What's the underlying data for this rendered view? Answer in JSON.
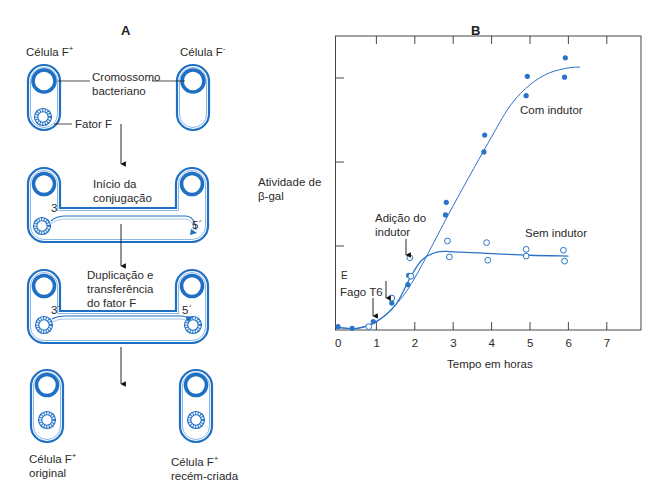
{
  "panel_a": {
    "letter": "A",
    "cell_f_plus_label": "Célula F",
    "cell_f_plus_sup": "+",
    "cell_f_minus_label": "Célula F",
    "cell_f_minus_sup": "-",
    "chromosome_label_line1": "Cromossomo",
    "chromosome_label_line2": "bacteriano",
    "fator_f_label": "Fator F",
    "step2_line1": "Início da",
    "step2_line2": "conjugação",
    "step2_end3": "3",
    "step2_end5": "5´",
    "step3_line1": "Duplicação e",
    "step3_line2": "transferência",
    "step3_line3": "do fator F",
    "step3_end3": "3´",
    "step3_end5": "5´",
    "result_left_line1": "Célula F",
    "result_left_sup": "+",
    "result_left_line2": "original",
    "result_right_line1": "Célula F",
    "result_right_sup": "+",
    "result_right_line2": "recém-criada",
    "colors": {
      "cell_blue": "#1f6fc4",
      "cell_light": "#8cb8e6"
    }
  },
  "panel_b": {
    "letter": "B",
    "ylabel_line1": "Atividade de",
    "ylabel_line2": "β-gal",
    "xlabel": "Tempo em horas",
    "x_ticks": [
      "0",
      "1",
      "2",
      "3",
      "4",
      "5",
      "6",
      "7"
    ],
    "annot_inductor_line1": "Adição do",
    "annot_inductor_line2": "indutor",
    "annot_phage": "Fago T6",
    "annot_e": "E",
    "series_with_label": "Com indutor",
    "series_without_label": "Sem indutor"
  },
  "chart_data": {
    "type": "scatter",
    "title": "B",
    "xlabel": "Tempo em horas",
    "ylabel": "Atividade de β-gal",
    "xlim": [
      0,
      7.8
    ],
    "ylim": [
      0,
      3.5
    ],
    "x_ticks": [
      0,
      1,
      2,
      3,
      4,
      5,
      6,
      7
    ],
    "y_ticks": [
      1,
      2,
      3
    ],
    "grid": false,
    "annotations": [
      {
        "text": "Fago T6",
        "x": 1.0,
        "arrow": true
      },
      {
        "text": "",
        "x": 1.4,
        "arrow": true
      },
      {
        "text": "Adição do indutor",
        "x": 1.9,
        "arrow": true
      },
      {
        "text": "E",
        "x": 0.05,
        "y": 0.75
      }
    ],
    "series": [
      {
        "name": "Com indutor",
        "marker": "filled-circle",
        "points": [
          [
            0.0,
            0.04
          ],
          [
            0.37,
            0.02
          ],
          [
            0.92,
            0.1
          ],
          [
            1.4,
            0.32
          ],
          [
            1.82,
            0.54
          ],
          [
            1.84,
            0.65
          ],
          [
            2.8,
            1.37
          ],
          [
            2.82,
            1.52
          ],
          [
            3.8,
            2.12
          ],
          [
            3.82,
            2.32
          ],
          [
            4.9,
            2.79
          ],
          [
            4.93,
            3.02
          ],
          [
            5.9,
            3.01
          ],
          [
            5.92,
            3.24
          ]
        ],
        "curve": [
          [
            0.0,
            0.03
          ],
          [
            0.5,
            0.02
          ],
          [
            1.0,
            0.1
          ],
          [
            1.5,
            0.3
          ],
          [
            2.0,
            0.62
          ],
          [
            3.0,
            1.48
          ],
          [
            4.0,
            2.3
          ],
          [
            4.5,
            2.68
          ],
          [
            5.0,
            2.92
          ],
          [
            5.5,
            3.06
          ],
          [
            6.0,
            3.12
          ],
          [
            6.3,
            3.13
          ]
        ]
      },
      {
        "name": "Sem indutor",
        "marker": "open-circle",
        "points": [
          [
            0.8,
            0.04
          ],
          [
            1.4,
            0.38
          ],
          [
            1.87,
            0.86
          ],
          [
            1.9,
            0.64
          ],
          [
            2.85,
            1.06
          ],
          [
            2.9,
            0.87
          ],
          [
            3.87,
            1.04
          ],
          [
            3.9,
            0.83
          ],
          [
            4.9,
            0.96
          ],
          [
            4.9,
            0.88
          ],
          [
            5.87,
            0.95
          ],
          [
            5.9,
            0.82
          ]
        ],
        "curve": [
          [
            0.0,
            0.03
          ],
          [
            0.5,
            0.02
          ],
          [
            1.0,
            0.1
          ],
          [
            1.5,
            0.3
          ],
          [
            1.9,
            0.64
          ],
          [
            2.2,
            0.84
          ],
          [
            2.6,
            0.93
          ],
          [
            3.0,
            0.93
          ],
          [
            4.0,
            0.91
          ],
          [
            5.0,
            0.89
          ],
          [
            6.0,
            0.88
          ]
        ]
      }
    ]
  }
}
